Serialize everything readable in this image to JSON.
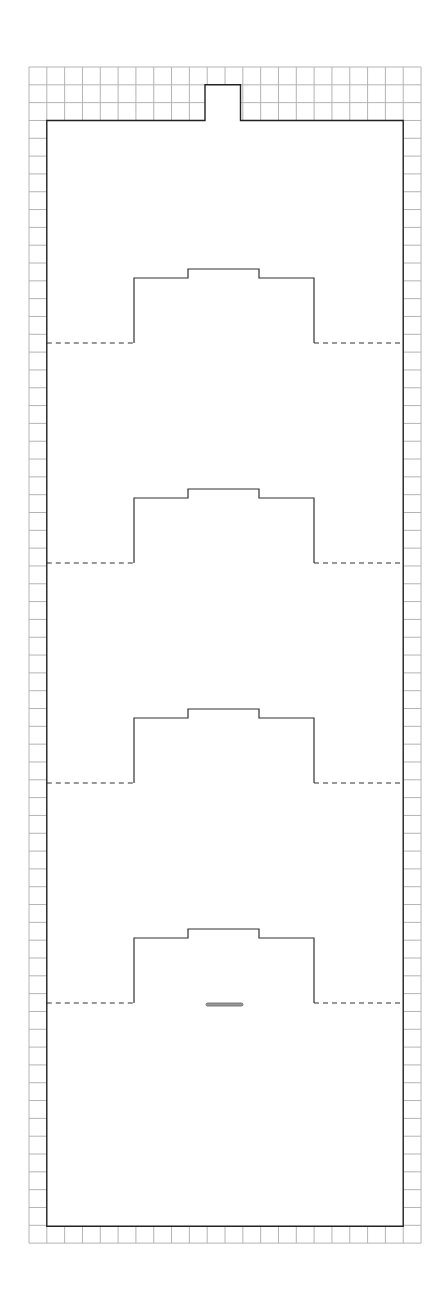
{
  "diagram": {
    "grid": {
      "x0": 29,
      "y0": 67,
      "cols": 22,
      "rows": 66,
      "cell": 17.82,
      "color": "#b4b4b4"
    },
    "outline": {
      "left": 46.8,
      "right": 403.2,
      "top": 120.5,
      "bottom": 1226.2,
      "notch": {
        "x1": 205,
        "x2": 240.5,
        "top": 84.8
      },
      "color": "#222222"
    },
    "profiles": {
      "baselines": [
        343,
        563,
        783,
        1003
      ],
      "left_x": 134,
      "right_x": 314,
      "shoulder_rise": 65,
      "top_rise": 74,
      "step_left_x": 188,
      "step_right_x": 259,
      "dash_left_x": 46.8,
      "dash_right_x": 403.2
    },
    "marker_bar": {
      "x": 206,
      "y": 1003,
      "width": 37,
      "height": 3
    }
  }
}
